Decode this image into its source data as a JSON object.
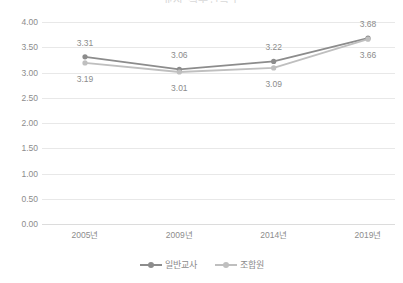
{
  "chart_data": {
    "type": "line",
    "title": "교사 직무만족도",
    "categories": [
      "2005년",
      "2009년",
      "2014년",
      "2019년"
    ],
    "series": [
      {
        "name": "일반교사",
        "values": [
          3.31,
          3.06,
          3.22,
          3.68
        ],
        "color": "#8c8c8c",
        "label_position": "above"
      },
      {
        "name": "조합원",
        "values": [
          3.19,
          3.01,
          3.09,
          3.66
        ],
        "color": "#bfbfbf",
        "label_position": "below"
      }
    ],
    "xlabel": "",
    "ylabel": "",
    "ylim": [
      0.0,
      4.0
    ],
    "y_ticks": [
      "0.00",
      "0.50",
      "1.00",
      "1.50",
      "2.00",
      "2.50",
      "3.00",
      "3.50",
      "4.00"
    ],
    "grid": true,
    "legend_position": "bottom",
    "marker": "circle",
    "data_labels_shown": true
  },
  "legend": {
    "items": [
      {
        "label": "일반교사",
        "color": "#8c8c8c"
      },
      {
        "label": "조합원",
        "color": "#bfbfbf"
      }
    ]
  }
}
